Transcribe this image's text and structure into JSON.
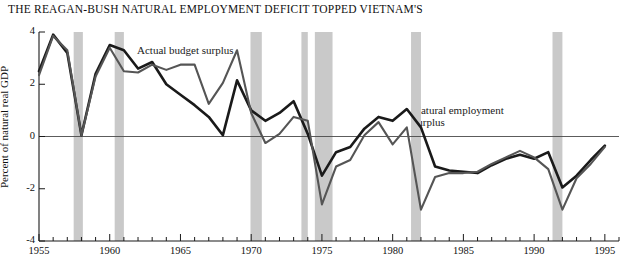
{
  "chart_data": {
    "type": "line",
    "title": "THE REAGAN-BUSH NATURAL EMPLOYMENT DEFICIT TOPPED VIETNAM'S",
    "xlabel": "",
    "ylabel": "Percent of natural real GDP",
    "xlim": [
      1955,
      1996
    ],
    "ylim": [
      -4,
      4
    ],
    "yticks": [
      4,
      2,
      0,
      -2,
      -4
    ],
    "ytick_labels": [
      "4",
      "2",
      "0",
      "-2",
      "-4"
    ],
    "xticks": [
      1955,
      1960,
      1965,
      1970,
      1975,
      1980,
      1985,
      1990,
      1995
    ],
    "xtick_labels": [
      "1955",
      "1960",
      "1965",
      "1970",
      "1975",
      "1980",
      "1985",
      "1990",
      "1995"
    ],
    "minor_xticks_every": 1,
    "grid": false,
    "zero_line": true,
    "legend_position": "inline-annotation",
    "x": [
      1955,
      1956,
      1957,
      1958,
      1959,
      1960,
      1961,
      1962,
      1963,
      1964,
      1965,
      1966,
      1967,
      1968,
      1969,
      1970,
      1971,
      1972,
      1973,
      1974,
      1975,
      1976,
      1977,
      1978,
      1979,
      1980,
      1981,
      1982,
      1983,
      1984,
      1985,
      1986,
      1987,
      1988,
      1989,
      1990,
      1991,
      1992,
      1993,
      1994,
      1995
    ],
    "series": [
      {
        "name": "Natural employment surplus",
        "color": "#1a1a1a",
        "line_width": 2.6,
        "label_text": "Natural employment\nsurplus",
        "values": [
          2.5,
          3.9,
          3.2,
          0.05,
          2.4,
          3.5,
          3.3,
          2.6,
          2.85,
          2.0,
          1.6,
          1.2,
          0.75,
          0.05,
          2.15,
          1.0,
          0.6,
          0.9,
          1.35,
          0.1,
          -1.5,
          -0.6,
          -0.4,
          0.3,
          0.75,
          0.6,
          1.05,
          0.35,
          -1.15,
          -1.3,
          -1.35,
          -1.4,
          -1.1,
          -0.85,
          -0.7,
          -0.85,
          -0.6,
          -1.95,
          -1.5,
          -0.9,
          -0.35
        ]
      },
      {
        "name": "Actual budget surplus",
        "color": "#555555",
        "line_width": 2.1,
        "label_text": "Actual budget surplus",
        "values": [
          2.35,
          3.85,
          3.3,
          0.05,
          2.3,
          3.4,
          2.5,
          2.45,
          2.75,
          2.55,
          2.75,
          2.75,
          1.25,
          2.05,
          3.3,
          0.9,
          -0.25,
          0.1,
          0.75,
          0.6,
          -2.6,
          -1.15,
          -0.9,
          0.05,
          0.55,
          -0.3,
          0.35,
          -2.8,
          -1.55,
          -1.4,
          -1.4,
          -1.35,
          -1.05,
          -0.8,
          -0.55,
          -0.8,
          -1.25,
          -2.8,
          -1.6,
          -1.05,
          -0.4
        ]
      }
    ],
    "recession_bands": [
      {
        "start": 1957.45,
        "end": 1958.1
      },
      {
        "start": 1960.35,
        "end": 1961.0
      },
      {
        "start": 1969.95,
        "end": 1970.75
      },
      {
        "start": 1973.55,
        "end": 1974.0
      },
      {
        "start": 1974.5,
        "end": 1975.75
      },
      {
        "start": 1981.3,
        "end": 1982.0
      },
      {
        "start": 1991.3,
        "end": 1992.0
      }
    ],
    "band_color": "#c9c9c9"
  }
}
